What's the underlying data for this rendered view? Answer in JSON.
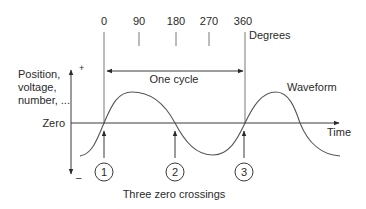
{
  "degree_axis": {
    "ticks": [
      "0",
      "90",
      "180",
      "270",
      "360"
    ],
    "unit_label": "Degrees"
  },
  "y_axis": {
    "label_lines": [
      "Position,",
      "voltage,",
      "number, ..."
    ],
    "plus_sign": "+",
    "minus_sign": "–",
    "zero_label": "Zero"
  },
  "x_axis": {
    "label": "Time"
  },
  "cycle": {
    "label": "One cycle"
  },
  "waveform": {
    "label": "Waveform"
  },
  "zero_crossings": {
    "markers": [
      "1",
      "2",
      "3"
    ],
    "caption": "Three zero crossings"
  }
}
